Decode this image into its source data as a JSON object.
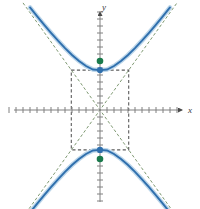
{
  "figure": {
    "background_color": "#ffffff",
    "width": 200,
    "height": 209
  },
  "axes": {
    "x_label": "x",
    "y_label": "y",
    "axis_color": "#808080",
    "origin_px": {
      "x": 100,
      "y": 110
    },
    "unit_px": 7,
    "x_tick_count_left": 13,
    "x_tick_count_right": 11,
    "y_tick_count_up": 14,
    "y_tick_count_down": 13,
    "tick_half_len_px": 3,
    "x_arrow": true,
    "y_arrow": true
  },
  "chart_data": {
    "type": "line",
    "xlabel": "x",
    "ylabel": "y",
    "xlim": [
      -14.3,
      12.9
    ],
    "ylim": [
      -13.6,
      15.7
    ],
    "grid": false,
    "legend": "none",
    "conic": {
      "kind": "hyperbola",
      "orientation": "vertical",
      "center": [
        0,
        0
      ],
      "a": 5.7,
      "b": 4.1,
      "c": 7.0,
      "vertices": [
        [
          0,
          5.7
        ],
        [
          0,
          -5.7
        ]
      ],
      "foci": [
        [
          0,
          7.0
        ],
        [
          0,
          -7.0
        ]
      ],
      "asymptote_slopes": [
        1.39,
        -1.39
      ]
    },
    "series": [
      {
        "name": "upper-branch",
        "role": "curve",
        "color": "#2f6fad",
        "style": "solid",
        "x": [
          -10.0,
          -9.0,
          -8.0,
          -7.0,
          -6.0,
          -5.0,
          -4.0,
          -3.0,
          -2.0,
          -1.0,
          0.0,
          1.0,
          2.0,
          3.0,
          4.0,
          5.0,
          6.0,
          7.0,
          8.0,
          9.0,
          10.0
        ],
        "y": [
          14.65,
          13.41,
          12.2,
          11.03,
          9.9,
          8.84,
          7.86,
          7.0,
          6.28,
          5.78,
          5.7,
          5.78,
          6.28,
          7.0,
          7.86,
          8.84,
          9.9,
          11.03,
          12.2,
          13.41,
          14.65
        ]
      },
      {
        "name": "lower-branch",
        "role": "curve",
        "color": "#2f6fad",
        "style": "solid",
        "x": [
          -10.0,
          -9.0,
          -8.0,
          -7.0,
          -6.0,
          -5.0,
          -4.0,
          -3.0,
          -2.0,
          -1.0,
          0.0,
          1.0,
          2.0,
          3.0,
          4.0,
          5.0,
          6.0,
          7.0,
          8.0,
          9.0,
          10.0
        ],
        "y": [
          -14.65,
          -13.41,
          -12.2,
          -11.03,
          -9.9,
          -8.84,
          -7.86,
          -7.0,
          -6.28,
          -5.78,
          -5.7,
          -5.78,
          -6.28,
          -7.0,
          -7.86,
          -8.84,
          -9.9,
          -11.03,
          -12.2,
          -13.41,
          -14.65
        ]
      },
      {
        "name": "asymptote-positive-slope",
        "role": "asymptote",
        "color": "#7f9a73",
        "style": "dashed",
        "x": [
          -11.0,
          11.0
        ],
        "y": [
          -15.3,
          15.3
        ]
      },
      {
        "name": "asymptote-negative-slope",
        "role": "asymptote",
        "color": "#7f9a73",
        "style": "dashed",
        "x": [
          -11.0,
          11.0
        ],
        "y": [
          15.3,
          -15.3
        ]
      }
    ],
    "annotations": {
      "central_rectangle": {
        "label": "central rectangle",
        "color": "#5c5c5c",
        "style": "dashed",
        "x_range": [
          -4.1,
          4.1
        ],
        "y_range": [
          -5.7,
          5.7
        ]
      },
      "points": [
        {
          "name": "upper-vertex",
          "kind": "vertex",
          "coords": [
            0,
            5.7
          ],
          "color": "#2f6fad"
        },
        {
          "name": "lower-vertex",
          "kind": "vertex",
          "coords": [
            0,
            -5.7
          ],
          "color": "#2f6fad"
        },
        {
          "name": "upper-focus",
          "kind": "focus",
          "coords": [
            0,
            7.0
          ],
          "color": "#1a7a4c"
        },
        {
          "name": "lower-focus",
          "kind": "focus",
          "coords": [
            0,
            -7.0
          ],
          "color": "#1a7a4c"
        }
      ]
    }
  },
  "colors": {
    "curve": "#2f6fad",
    "curve_halo": "#bcd6ea",
    "asymptote": "#7f9a73",
    "rectangle": "#5c5c5c",
    "axis": "#808080",
    "vertex_point": "#2f6fad",
    "focus_point": "#1a7a4c",
    "label_text": "#3a3a3a"
  }
}
